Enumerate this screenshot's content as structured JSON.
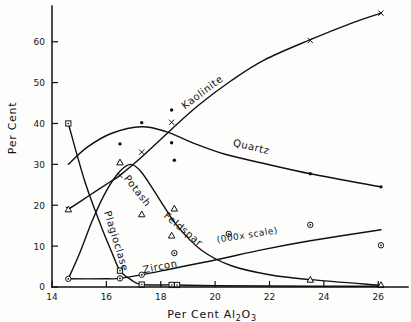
{
  "chart_data": {
    "type": "line",
    "title": "",
    "xlabel": "Per Cent Al2O3",
    "xlabel_parts": {
      "pre": "Per Cent  Al",
      "sub": "2",
      "mid": "O",
      "sub2": "3"
    },
    "ylabel": "Per Cent",
    "xlim": [
      14,
      26.8
    ],
    "ylim": [
      0,
      68
    ],
    "xticks": [
      14,
      16,
      18,
      20,
      22,
      24,
      26
    ],
    "yticks": [
      0,
      10,
      20,
      30,
      40,
      50,
      60
    ],
    "grid": false,
    "legend": "inline curve labels",
    "annotations": [
      {
        "text": "(000x scale)",
        "near_series": "Zircon",
        "x": 20.6,
        "y": 11.5
      }
    ],
    "series": [
      {
        "name": "Kaolinite",
        "marker": "x",
        "label_x": 19.6,
        "label_y": 47,
        "curve": [
          {
            "x": 14.6,
            "y": 19.0
          },
          {
            "x": 15.4,
            "y": 22.5
          },
          {
            "x": 16.2,
            "y": 26.0
          },
          {
            "x": 16.5,
            "y": 27.3
          },
          {
            "x": 17.3,
            "y": 31.8
          },
          {
            "x": 18.4,
            "y": 38.6
          },
          {
            "x": 19.4,
            "y": 44.5
          },
          {
            "x": 20.6,
            "y": 50.5
          },
          {
            "x": 21.8,
            "y": 55.5
          },
          {
            "x": 23.5,
            "y": 60.5
          },
          {
            "x": 25.0,
            "y": 64.5
          },
          {
            "x": 26.1,
            "y": 67.0
          }
        ],
        "points": [
          {
            "x": 14.6,
            "y": 19.0
          },
          {
            "x": 16.5,
            "y": 27.3
          },
          {
            "x": 17.3,
            "y": 33.0
          },
          {
            "x": 18.4,
            "y": 40.3
          },
          {
            "x": 23.5,
            "y": 60.3
          },
          {
            "x": 26.1,
            "y": 67.0
          }
        ]
      },
      {
        "name": "Quartz",
        "marker": "dot",
        "label_x": 21.3,
        "label_y": 33.5,
        "curve": [
          {
            "x": 14.6,
            "y": 30.0
          },
          {
            "x": 15.3,
            "y": 34.2
          },
          {
            "x": 16.2,
            "y": 37.6
          },
          {
            "x": 17.3,
            "y": 39.2
          },
          {
            "x": 18.2,
            "y": 38.0
          },
          {
            "x": 19.2,
            "y": 35.2
          },
          {
            "x": 20.4,
            "y": 32.4
          },
          {
            "x": 21.8,
            "y": 30.2
          },
          {
            "x": 23.5,
            "y": 27.7
          },
          {
            "x": 26.1,
            "y": 24.5
          }
        ],
        "points": [
          {
            "x": 16.5,
            "y": 35.0
          },
          {
            "x": 17.3,
            "y": 40.2
          },
          {
            "x": 18.4,
            "y": 43.3
          },
          {
            "x": 18.5,
            "y": 31.0
          },
          {
            "x": 18.4,
            "y": 35.3
          },
          {
            "x": 23.5,
            "y": 27.7
          },
          {
            "x": 26.1,
            "y": 24.5
          }
        ]
      },
      {
        "name": "Potash Feldspar",
        "marker": "triangle",
        "label_x": 17.4,
        "label_y": 19.5,
        "curve": [
          {
            "x": 14.6,
            "y": 2.0
          },
          {
            "x": 15.0,
            "y": 8.0
          },
          {
            "x": 15.5,
            "y": 16.5
          },
          {
            "x": 16.0,
            "y": 23.5
          },
          {
            "x": 16.5,
            "y": 28.3
          },
          {
            "x": 16.9,
            "y": 30.0
          },
          {
            "x": 17.3,
            "y": 28.0
          },
          {
            "x": 17.9,
            "y": 22.0
          },
          {
            "x": 18.6,
            "y": 15.0
          },
          {
            "x": 19.5,
            "y": 9.0
          },
          {
            "x": 20.6,
            "y": 5.2
          },
          {
            "x": 22.0,
            "y": 3.0
          },
          {
            "x": 23.5,
            "y": 1.8
          },
          {
            "x": 26.1,
            "y": 0.4
          }
        ],
        "points": [
          {
            "x": 14.6,
            "y": 19.0
          },
          {
            "x": 16.5,
            "y": 30.5
          },
          {
            "x": 17.3,
            "y": 17.8
          },
          {
            "x": 18.5,
            "y": 19.2
          },
          {
            "x": 18.4,
            "y": 12.6
          },
          {
            "x": 23.5,
            "y": 1.8
          },
          {
            "x": 26.1,
            "y": 0.5
          }
        ]
      },
      {
        "name": "Plagioclase",
        "marker": "square",
        "label_x": 16.1,
        "label_y": 11.5,
        "curve": [
          {
            "x": 14.6,
            "y": 40.0
          },
          {
            "x": 15.2,
            "y": 26.0
          },
          {
            "x": 15.8,
            "y": 15.0
          },
          {
            "x": 16.2,
            "y": 8.5
          },
          {
            "x": 16.5,
            "y": 4.0
          },
          {
            "x": 16.9,
            "y": 1.8
          },
          {
            "x": 17.3,
            "y": 0.6
          },
          {
            "x": 18.5,
            "y": 0.5
          },
          {
            "x": 20.0,
            "y": 0.3
          },
          {
            "x": 23.5,
            "y": 0.2
          },
          {
            "x": 26.1,
            "y": 0.2
          }
        ],
        "points": [
          {
            "x": 14.6,
            "y": 40.0
          },
          {
            "x": 16.5,
            "y": 4.0
          },
          {
            "x": 17.3,
            "y": 0.6
          },
          {
            "x": 18.4,
            "y": 0.5
          },
          {
            "x": 18.6,
            "y": 0.5
          }
        ]
      },
      {
        "name": "Zircon",
        "marker": "circle-dot",
        "label_x": 18.0,
        "label_y": 4.2,
        "curve": [
          {
            "x": 14.6,
            "y": 2.0
          },
          {
            "x": 16.0,
            "y": 2.0
          },
          {
            "x": 16.5,
            "y": 2.1
          },
          {
            "x": 17.3,
            "y": 3.0
          },
          {
            "x": 18.5,
            "y": 4.6
          },
          {
            "x": 20.0,
            "y": 6.6
          },
          {
            "x": 21.8,
            "y": 9.2
          },
          {
            "x": 23.5,
            "y": 11.3
          },
          {
            "x": 26.1,
            "y": 14.0
          }
        ],
        "points": [
          {
            "x": 14.6,
            "y": 2.0
          },
          {
            "x": 16.5,
            "y": 2.1
          },
          {
            "x": 17.3,
            "y": 3.0
          },
          {
            "x": 18.5,
            "y": 8.3
          },
          {
            "x": 20.5,
            "y": 13.0
          },
          {
            "x": 23.5,
            "y": 15.2
          },
          {
            "x": 26.1,
            "y": 10.2
          }
        ]
      }
    ]
  },
  "axes": {
    "x_tick_labels": [
      "14",
      "16",
      "18",
      "20",
      "22",
      "24",
      "26"
    ],
    "y_tick_labels": [
      "0",
      "10",
      "20",
      "30",
      "40",
      "50",
      "60"
    ],
    "x_title": "Per Cent  Al",
    "x_title_sub1": "2",
    "x_title_mid": "O",
    "x_title_sub2": "3",
    "y_title": "Per Cent"
  },
  "labels": {
    "kaolinite": "Kaolinite",
    "quartz": "Quartz",
    "potash": "Potash",
    "feldspar": "Feldspar",
    "plagioclase": "Plagioclase",
    "zircon": "Zircon",
    "scale_note": "(000x scale)"
  }
}
